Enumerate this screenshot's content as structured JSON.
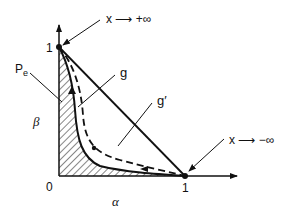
{
  "diagram": {
    "axes": {
      "x_label": "α",
      "y_label": "β",
      "origin_label": "0",
      "x_tick": "1",
      "y_tick": "1"
    },
    "annotations": {
      "top": "x ⟶ +∞",
      "bottom": "x ⟶ −∞",
      "pe": "P",
      "pe_sub": "e",
      "g": "g",
      "g_prime": "g′"
    },
    "curves": [
      {
        "name": "g",
        "style": "solid",
        "description": "lower-left bowed curve from (0,1) to (1,0)"
      },
      {
        "name": "g′",
        "style": "dashed",
        "description": "dashed curve between g and diagonal"
      },
      {
        "name": "diagonal",
        "style": "solid",
        "description": "straight line from (0,1) to (1,0)"
      }
    ],
    "shaded_region": "P_e region under curve g (hatched)"
  }
}
